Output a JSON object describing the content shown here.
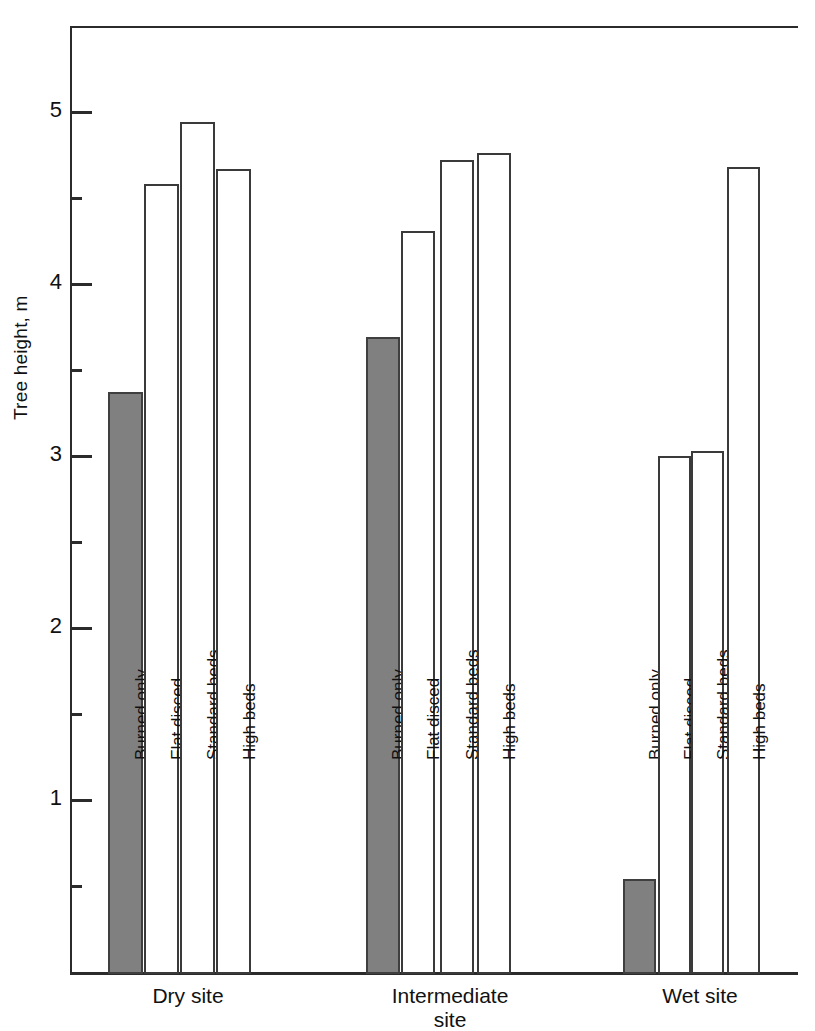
{
  "chart_data": {
    "type": "bar",
    "title": "",
    "xlabel": "",
    "ylabel": "Tree height, m",
    "ylim": [
      0,
      5.5
    ],
    "ytick_labels": [
      "1",
      "2",
      "3",
      "4",
      "5"
    ],
    "ytick_values": [
      1,
      2,
      3,
      4,
      5
    ],
    "yminor_values": [
      0.5,
      1.5,
      2.5,
      3.5,
      4.5
    ],
    "grid": false,
    "legend": "none",
    "categories": [
      "Dry site",
      "Intermediate site",
      "Wet site"
    ],
    "series": [
      {
        "name": "Burned only",
        "values": [
          3.37,
          3.69,
          0.54
        ],
        "fill": "#808080"
      },
      {
        "name": "Flat disced",
        "values": [
          4.58,
          4.31,
          3.0
        ],
        "fill": "#ffffff"
      },
      {
        "name": "Standard beds",
        "values": [
          4.94,
          4.72,
          3.03
        ],
        "fill": "#ffffff"
      },
      {
        "name": "High beds",
        "values": [
          4.67,
          4.76,
          4.68
        ],
        "fill": "#ffffff"
      }
    ]
  },
  "axis": {
    "y_label": "Tree height, m",
    "ticks": [
      {
        "label": "5",
        "value": 5
      },
      {
        "label": "4",
        "value": 4
      },
      {
        "label": "3",
        "value": 3
      },
      {
        "label": "2",
        "value": 2
      },
      {
        "label": "1",
        "value": 1
      }
    ]
  },
  "groups": [
    {
      "id": "dry",
      "label_line1": "Dry site",
      "label_line2": "",
      "bars": [
        {
          "name": "Burned only",
          "value": 3.37,
          "filled": true
        },
        {
          "name": "Flat disced",
          "value": 4.58,
          "filled": false
        },
        {
          "name": "Standard beds",
          "value": 4.94,
          "filled": false
        },
        {
          "name": "High beds",
          "value": 4.67,
          "filled": false
        }
      ]
    },
    {
      "id": "intermediate",
      "label_line1": "Intermediate",
      "label_line2": "site",
      "bars": [
        {
          "name": "Burned only",
          "value": 3.69,
          "filled": true
        },
        {
          "name": "Flat disced",
          "value": 4.31,
          "filled": false
        },
        {
          "name": "Standard beds",
          "value": 4.72,
          "filled": false
        },
        {
          "name": "High beds",
          "value": 4.76,
          "filled": false
        }
      ]
    },
    {
      "id": "wet",
      "label_line1": "Wet site",
      "label_line2": "",
      "bars": [
        {
          "name": "Burned only",
          "value": 0.54,
          "filled": true
        },
        {
          "name": "Flat disced",
          "value": 3.0,
          "filled": false
        },
        {
          "name": "Standard beds",
          "value": 3.03,
          "filled": false
        },
        {
          "name": "High beds",
          "value": 4.68,
          "filled": false
        }
      ]
    }
  ],
  "colors": {
    "bar_fill_dark": "#808080",
    "bar_fill_light": "#ffffff",
    "bar_stroke": "#3a3a3a",
    "axis": "#2b2b2b",
    "text": "#111111",
    "background": "#ffffff"
  }
}
